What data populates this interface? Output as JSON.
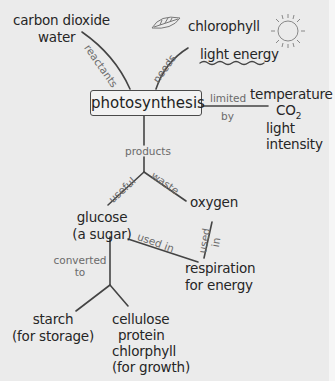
{
  "center": "photosynthesis",
  "reactants": {
    "label": "reactants",
    "items": [
      "carbon dioxide",
      "water"
    ]
  },
  "needs": {
    "label": "needs",
    "items": [
      "chlorophyll",
      "light energy"
    ]
  },
  "limited_by": {
    "label_top": "limited",
    "label_bottom": "by",
    "items": [
      "temperature",
      "CO",
      "2",
      "light",
      "intensity"
    ]
  },
  "products": {
    "label": "products",
    "useful": {
      "label": "useful",
      "item_line1": "glucose",
      "item_line2": "(a sugar)"
    },
    "waste": {
      "label": "waste",
      "item": "oxygen"
    }
  },
  "used_in": {
    "label1": "used in",
    "label2": "used",
    "label3": "in",
    "item_line1": "respiration",
    "item_line2": "for energy"
  },
  "converted_to": {
    "label_line1": "converted",
    "label_line2": "to",
    "starch_line1": "starch",
    "starch_line2": "(for storage)",
    "growth_lines": [
      "cellulose",
      "protein",
      "chlorphyll",
      "(for growth)"
    ]
  },
  "icons": {
    "leaf": "leaf-icon",
    "sun": "sun-icon"
  }
}
